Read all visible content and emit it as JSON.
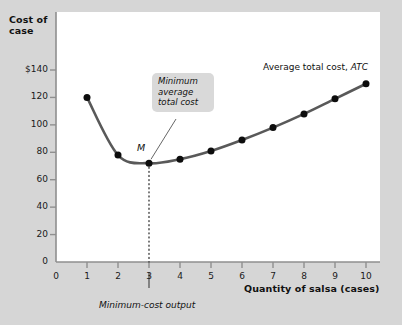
{
  "chart_data": {
    "type": "line",
    "title": "",
    "xlabel": "Quantity of salsa (cases)",
    "ylabel": "Cost of\ncase",
    "xlim": [
      0,
      10.6
    ],
    "ylim": [
      0,
      148
    ],
    "grid": false,
    "legend_position": "inline-annotation",
    "x": [
      1,
      2,
      3,
      4,
      5,
      6,
      7,
      8,
      9,
      10
    ],
    "series": [
      {
        "name": "Average total cost, ATC",
        "values": [
          120,
          78,
          72,
          75,
          81,
          89,
          98,
          108,
          119,
          130
        ]
      }
    ],
    "x_tick_labels": [
      "0",
      "1",
      "2",
      "3",
      "4",
      "5",
      "6",
      "7",
      "8",
      "9",
      "10"
    ],
    "x_tick_values": [
      0,
      1,
      2,
      3,
      4,
      5,
      6,
      7,
      8,
      9,
      10
    ],
    "y_tick_labels": [
      "0",
      "20",
      "40",
      "60",
      "80",
      "100",
      "120",
      "$140"
    ],
    "y_tick_values": [
      0,
      20,
      40,
      60,
      80,
      100,
      120,
      140
    ],
    "annotations": [
      {
        "name": "minimum-point-marker",
        "text": "M",
        "x": 3,
        "y": 72
      },
      {
        "name": "minimum-callout",
        "text": "Minimum average total cost",
        "lines": [
          "Minimum",
          "average",
          "total cost"
        ],
        "points_to_x": 3,
        "points_to_y": 72
      },
      {
        "name": "series-label",
        "text_plain": "Average total cost,",
        "text_italic": "ATC"
      },
      {
        "name": "minimum-cost-output-label",
        "text": "Minimum-cost output",
        "at_x": 3
      }
    ],
    "dropline": {
      "x": 3,
      "from_y": 72,
      "to_y": 0,
      "style": "dotted"
    }
  },
  "colors": {
    "background": "#d6d6d6",
    "plot_area": "#ffffff",
    "curve": "#595959",
    "marker": "#0d0d0d",
    "axis": "#8a8a8a",
    "text": "#111111",
    "callout_bg": "#d9d9d9"
  },
  "axis": {
    "y_title": "Cost of\ncase",
    "x_title": "Quantity of salsa (cases)"
  },
  "labels": {
    "atc_plain": "Average total cost, ",
    "atc_italic": "ATC",
    "m": "M",
    "callout_line1": "Minimum",
    "callout_line2": "average",
    "callout_line3": "total cost",
    "min_cost_output": "Minimum-cost output"
  },
  "y_ticks": [
    {
      "label": "$140",
      "value": 140
    },
    {
      "label": "120",
      "value": 120
    },
    {
      "label": "100",
      "value": 100
    },
    {
      "label": "80",
      "value": 80
    },
    {
      "label": "60",
      "value": 60
    },
    {
      "label": "40",
      "value": 40
    },
    {
      "label": "20",
      "value": 20
    },
    {
      "label": "0",
      "value": 0
    }
  ],
  "x_ticks": [
    {
      "label": "0",
      "value": 0
    },
    {
      "label": "1",
      "value": 1
    },
    {
      "label": "2",
      "value": 2
    },
    {
      "label": "3",
      "value": 3
    },
    {
      "label": "4",
      "value": 4
    },
    {
      "label": "5",
      "value": 5
    },
    {
      "label": "6",
      "value": 6
    },
    {
      "label": "7",
      "value": 7
    },
    {
      "label": "8",
      "value": 8
    },
    {
      "label": "9",
      "value": 9
    },
    {
      "label": "10",
      "value": 10
    }
  ]
}
